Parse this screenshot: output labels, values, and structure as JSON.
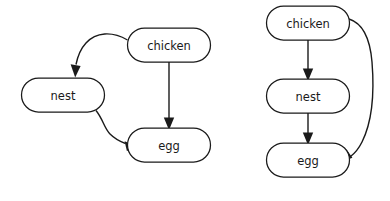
{
  "figure": {
    "type": "directed-acyclic-graph-pair",
    "background_color": "#ffffff",
    "stroke_color": "#1a1a1a",
    "node_fill_color": "#ffffff",
    "text_color": "#1a1a1a"
  },
  "graphs": [
    {
      "id": "left-graph",
      "layout": "free",
      "nodes": [
        {
          "id": "chicken",
          "label": "chicken",
          "x": 169,
          "y": 45,
          "w": 83,
          "h": 34
        },
        {
          "id": "nest",
          "label": "nest",
          "x": 63,
          "y": 95,
          "w": 83,
          "h": 34
        },
        {
          "id": "egg",
          "label": "egg",
          "x": 169,
          "y": 145,
          "w": 83,
          "h": 34
        }
      ],
      "edges": [
        {
          "from": "chicken",
          "to": "nest",
          "style": "curved",
          "direction": "directed"
        },
        {
          "from": "chicken",
          "to": "egg",
          "style": "straight",
          "direction": "directed"
        },
        {
          "from": "nest",
          "to": "egg",
          "style": "curved",
          "direction": "directed"
        }
      ]
    },
    {
      "id": "right-graph",
      "layout": "hierarchical",
      "nodes": [
        {
          "id": "chicken",
          "label": "chicken",
          "x": 308,
          "y": 23,
          "w": 83,
          "h": 34
        },
        {
          "id": "nest",
          "label": "nest",
          "x": 308,
          "y": 96,
          "w": 83,
          "h": 34
        },
        {
          "id": "egg",
          "label": "egg",
          "x": 308,
          "y": 160,
          "w": 83,
          "h": 34
        }
      ],
      "edges": [
        {
          "from": "chicken",
          "to": "nest",
          "style": "straight",
          "direction": "directed"
        },
        {
          "from": "nest",
          "to": "egg",
          "style": "straight",
          "direction": "directed"
        },
        {
          "from": "chicken",
          "to": "egg",
          "style": "curved-right-arc",
          "direction": "directed"
        }
      ]
    }
  ]
}
